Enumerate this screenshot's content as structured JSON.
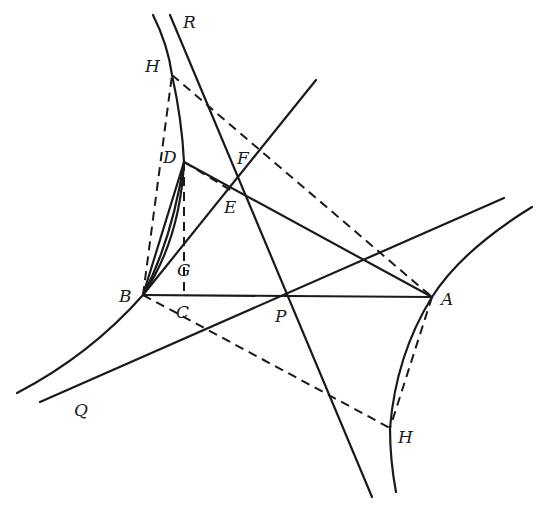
{
  "diagram": {
    "type": "geometric-construction",
    "labels": {
      "R": "R",
      "H_top": "H",
      "D": "D",
      "F": "F",
      "E": "E",
      "G": "G",
      "B": "B",
      "C": "C",
      "P": "P",
      "A": "A",
      "Q": "Q",
      "H_bottom": "H"
    },
    "points": {
      "B": [
        143,
        295
      ],
      "A": [
        432,
        297
      ],
      "P": [
        288,
        297
      ],
      "D": [
        184,
        162
      ],
      "E": [
        237,
        180
      ],
      "F": [
        252,
        150
      ],
      "H_top": [
        172,
        75
      ],
      "H_bottom": [
        390,
        428
      ]
    },
    "colors": {
      "stroke": "#1a1a1a",
      "background": "#ffffff"
    }
  }
}
